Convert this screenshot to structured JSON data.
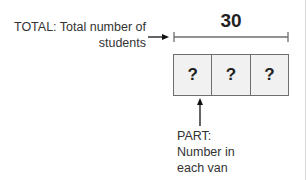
{
  "diagram": {
    "type": "tape-diagram",
    "total": {
      "label_line1": "TOTAL: Total number of",
      "label_line2": "students",
      "value": "30"
    },
    "parts": [
      {
        "label": "?"
      },
      {
        "label": "?"
      },
      {
        "label": "?"
      }
    ],
    "part_annotation": {
      "line1": "PART:",
      "line2": "Number in",
      "line3": "each van"
    },
    "colors": {
      "box_fill": "#f1f1f1",
      "box_border": "#6e6e6e",
      "bracket": "#6e6e6e",
      "text": "#222222"
    }
  }
}
